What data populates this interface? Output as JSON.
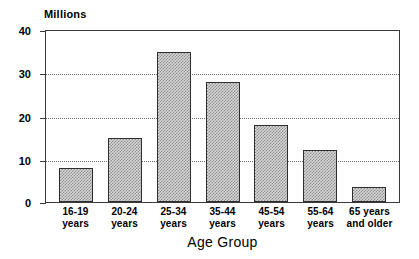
{
  "chart_data": {
    "type": "bar",
    "title": "",
    "subtitle": "",
    "unit_label": "Millions",
    "xlabel": "Age Group",
    "ylabel": "Millions",
    "ylim": [
      0,
      40
    ],
    "yticks": [
      0,
      10,
      20,
      30,
      40
    ],
    "ytick_labels": [
      "0",
      "10",
      "20",
      "30",
      "40"
    ],
    "grid": "horizontal-dotted at 10, 20, 30",
    "legend": "none",
    "categories": [
      "16-19 years",
      "20-24 years",
      "25-34 years",
      "35-44 years",
      "45-54 years",
      "55-64 years",
      "65 years and older"
    ],
    "category_lines": [
      {
        "line1": "16-19",
        "line2": "years"
      },
      {
        "line1": "20-24",
        "line2": "years"
      },
      {
        "line1": "25-34",
        "line2": "years"
      },
      {
        "line1": "35-44",
        "line2": "years"
      },
      {
        "line1": "45-54",
        "line2": "years"
      },
      {
        "line1": "55-64",
        "line2": "years"
      },
      {
        "line1": "65 years",
        "line2": "and older"
      }
    ],
    "values": [
      8,
      15,
      35,
      28,
      18,
      12,
      3.5
    ],
    "colors": {
      "bar_fill": "#d8d8d8",
      "bar_hatch": "#8d8d8d",
      "bar_border": "#2e2e2e",
      "axis": "#3a3a3a",
      "gridline": "#6b6b6b",
      "background": "#ffffff",
      "text": "#000000"
    }
  }
}
